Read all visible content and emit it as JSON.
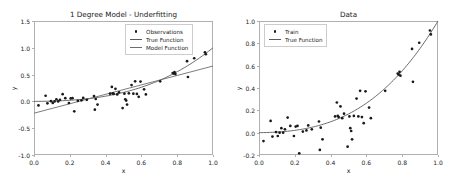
{
  "figure": {
    "width": 456,
    "height": 189,
    "background": "#ffffff",
    "marker_color": "#1a1a1a",
    "true_function_color": "#595959",
    "model_function_color": "#6e6e6e",
    "axis_color": "#b0b0b0"
  },
  "chart_data": [
    {
      "id": "left-plot",
      "type": "scatter",
      "title": "1 Degree Model - Underfitting",
      "xlabel": "x",
      "ylabel": "y",
      "xlim": [
        0.0,
        1.0
      ],
      "ylim": [
        -1.0,
        1.5
      ],
      "grid": false,
      "legend_position": "upper right",
      "xticks": [
        "0.0",
        "0.2",
        "0.4",
        "0.6",
        "0.8",
        "1.0"
      ],
      "xtick_values": [
        0.0,
        0.2,
        0.4,
        0.6,
        0.8,
        1.0
      ],
      "yticks": [
        "-1.0",
        "-0.5",
        "0.0",
        "0.5",
        "1.0",
        "1.5"
      ],
      "ytick_values": [
        -1.0,
        -0.5,
        0.0,
        0.5,
        1.0,
        1.5
      ],
      "legend": [
        {
          "label": "Observations",
          "kind": "marker",
          "color": "#1a1a1a"
        },
        {
          "label": "True Function",
          "kind": "line",
          "color": "#595959"
        },
        {
          "label": "Model Function",
          "kind": "line",
          "color": "#6e6e6e"
        }
      ],
      "series": [
        {
          "name": "Observations",
          "kind": "scatter",
          "color": "#1a1a1a",
          "x": [
            0.025,
            0.065,
            0.075,
            0.095,
            0.105,
            0.115,
            0.125,
            0.135,
            0.145,
            0.16,
            0.175,
            0.195,
            0.205,
            0.215,
            0.225,
            0.245,
            0.265,
            0.275,
            0.295,
            0.335,
            0.34,
            0.345,
            0.355,
            0.425,
            0.435,
            0.44,
            0.445,
            0.455,
            0.465,
            0.475,
            0.495,
            0.505,
            0.51,
            0.515,
            0.52,
            0.53,
            0.545,
            0.555,
            0.565,
            0.575,
            0.585,
            0.595,
            0.615,
            0.625,
            0.705,
            0.775,
            0.78,
            0.785,
            0.79,
            0.855,
            0.86,
            0.895,
            0.955,
            0.96
          ],
          "y": [
            -0.075,
            0.105,
            -0.035,
            0.005,
            -0.03,
            0.0,
            0.04,
            0.0,
            0.03,
            0.135,
            0.06,
            -0.03,
            0.055,
            0.06,
            -0.185,
            0.01,
            0.02,
            0.065,
            0.03,
            0.1,
            -0.155,
            0.045,
            -0.06,
            0.145,
            0.27,
            0.15,
            0.14,
            0.235,
            0.13,
            0.17,
            -0.125,
            0.145,
            0.04,
            0.015,
            -0.06,
            0.15,
            0.305,
            0.145,
            0.375,
            0.14,
            0.085,
            0.37,
            0.225,
            0.13,
            0.375,
            0.53,
            0.52,
            0.545,
            0.51,
            0.75,
            0.455,
            0.805,
            0.915,
            0.88
          ]
        },
        {
          "name": "True Function",
          "kind": "line",
          "color": "#595959",
          "description": "cubic-like rising curve from ~0.00 at x=0 to ~1.00 at x=1"
        },
        {
          "name": "Model Function",
          "kind": "line",
          "color": "#6e6e6e",
          "description": "degree-1 fit: straight line from ~-0.22 at x=0 to ~0.66 at x=1"
        }
      ]
    },
    {
      "id": "right-plot",
      "type": "scatter",
      "title": "Data",
      "xlabel": "x",
      "ylabel": "y",
      "xlim": [
        0.0,
        1.0
      ],
      "ylim": [
        -0.2,
        1.0
      ],
      "grid": false,
      "legend_position": "upper left",
      "xticks": [
        "0.0",
        "0.2",
        "0.4",
        "0.6",
        "0.8",
        "1.0"
      ],
      "xtick_values": [
        0.0,
        0.2,
        0.4,
        0.6,
        0.8,
        1.0
      ],
      "yticks": [
        "-0.2",
        "0.0",
        "0.2",
        "0.4",
        "0.6",
        "0.8",
        "1.0"
      ],
      "ytick_values": [
        -0.2,
        0.0,
        0.2,
        0.4,
        0.6,
        0.8,
        1.0
      ],
      "legend": [
        {
          "label": "Train",
          "kind": "marker",
          "color": "#1a1a1a"
        },
        {
          "label": "True Function",
          "kind": "line",
          "color": "#595959"
        }
      ],
      "series": [
        {
          "name": "Train",
          "kind": "scatter",
          "color": "#1a1a1a",
          "x": [
            0.025,
            0.065,
            0.075,
            0.095,
            0.105,
            0.115,
            0.125,
            0.135,
            0.145,
            0.16,
            0.175,
            0.195,
            0.205,
            0.215,
            0.225,
            0.245,
            0.265,
            0.275,
            0.295,
            0.335,
            0.34,
            0.345,
            0.355,
            0.425,
            0.435,
            0.44,
            0.445,
            0.455,
            0.465,
            0.475,
            0.495,
            0.505,
            0.51,
            0.515,
            0.52,
            0.53,
            0.545,
            0.555,
            0.565,
            0.575,
            0.585,
            0.595,
            0.615,
            0.625,
            0.705,
            0.775,
            0.78,
            0.785,
            0.79,
            0.855,
            0.86,
            0.895,
            0.955,
            0.96
          ],
          "y": [
            -0.075,
            0.105,
            -0.035,
            0.005,
            -0.03,
            0.0,
            0.04,
            0.0,
            0.03,
            0.135,
            0.06,
            -0.03,
            0.055,
            0.06,
            -0.185,
            0.01,
            0.02,
            0.065,
            0.03,
            0.1,
            -0.155,
            0.045,
            -0.06,
            0.145,
            0.27,
            0.15,
            0.14,
            0.235,
            0.13,
            0.17,
            -0.125,
            0.145,
            0.04,
            0.015,
            -0.06,
            0.15,
            0.305,
            0.145,
            0.375,
            0.14,
            0.085,
            0.37,
            0.225,
            0.13,
            0.375,
            0.53,
            0.52,
            0.545,
            0.51,
            0.75,
            0.455,
            0.805,
            0.915,
            0.88
          ]
        },
        {
          "name": "True Function",
          "kind": "line",
          "color": "#595959",
          "description": "cubic-like rising curve from ~0.00 at x=0 to ~1.00 at x=1"
        }
      ]
    }
  ]
}
